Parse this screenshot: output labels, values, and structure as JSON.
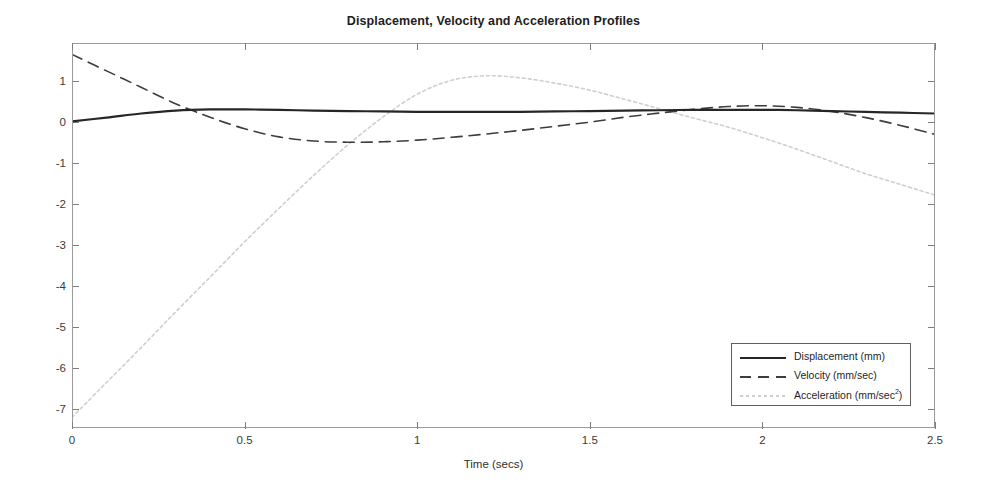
{
  "chart_data": {
    "type": "line",
    "title": "Displacement, Velocity and Acceleration Profiles",
    "xlabel": "Time (secs)",
    "ylabel": "",
    "xlim": [
      0,
      2.5
    ],
    "ylim": [
      -7.46,
      1.93
    ],
    "grid": false,
    "legend_position": "lower right",
    "xticks": [
      {
        "value": 0,
        "label": "0"
      },
      {
        "value": 0.5,
        "label": "0.5"
      },
      {
        "value": 1,
        "label": "1"
      },
      {
        "value": 1.5,
        "label": "1.5"
      },
      {
        "value": 2,
        "label": "2"
      },
      {
        "value": 2.5,
        "label": "2.5"
      }
    ],
    "yticks": [
      {
        "value": 1,
        "label": "1"
      },
      {
        "value": 0,
        "label": "0"
      },
      {
        "value": -1,
        "label": "-1"
      },
      {
        "value": -2,
        "label": "-2"
      },
      {
        "value": -3,
        "label": "-3"
      },
      {
        "value": -4,
        "label": "-4"
      },
      {
        "value": -5,
        "label": "-5"
      },
      {
        "value": -6,
        "label": "-6"
      },
      {
        "value": -7,
        "label": "-7"
      }
    ],
    "x": [
      0,
      0.1,
      0.2,
      0.3,
      0.4,
      0.5,
      0.6,
      0.7,
      0.8,
      0.9,
      1.0,
      1.1,
      1.2,
      1.3,
      1.4,
      1.5,
      1.6,
      1.7,
      1.8,
      1.9,
      2.0,
      2.1,
      2.2,
      2.3,
      2.4,
      2.5
    ],
    "series": [
      {
        "name": "Displacement (mm)",
        "unit": "mm",
        "style": "solid",
        "color": "#262626",
        "width": 2.2,
        "values": [
          0.02,
          0.11,
          0.21,
          0.28,
          0.31,
          0.31,
          0.3,
          0.28,
          0.27,
          0.26,
          0.25,
          0.25,
          0.25,
          0.25,
          0.26,
          0.27,
          0.28,
          0.29,
          0.3,
          0.3,
          0.3,
          0.29,
          0.27,
          0.25,
          0.23,
          0.21
        ]
      },
      {
        "name": "Velocity (mm/sec)",
        "unit": "mm/sec",
        "style": "dashed",
        "color": "#3d3d3d",
        "width": 1.6,
        "values": [
          1.65,
          1.25,
          0.85,
          0.45,
          0.12,
          -0.16,
          -0.36,
          -0.46,
          -0.49,
          -0.48,
          -0.44,
          -0.37,
          -0.29,
          -0.2,
          -0.1,
          0.0,
          0.12,
          0.22,
          0.31,
          0.38,
          0.4,
          0.36,
          0.26,
          0.11,
          -0.08,
          -0.3
        ]
      },
      {
        "name": "Acceleration (mm/sec^2)",
        "unit": "mm/sec²",
        "style": "dotted",
        "color": "#cfcfcf",
        "width": 1.6,
        "values": [
          -7.2,
          -6.35,
          -5.5,
          -4.63,
          -3.78,
          -2.92,
          -2.1,
          -1.3,
          -0.55,
          0.12,
          0.68,
          1.02,
          1.13,
          1.08,
          0.95,
          0.78,
          0.56,
          0.33,
          0.1,
          -0.12,
          -0.38,
          -0.66,
          -0.96,
          -1.26,
          -1.52,
          -1.78
        ]
      }
    ]
  },
  "legend": {
    "items": [
      {
        "label": "Displacement (mm)",
        "base": "Displacement (mm)",
        "sup": ""
      },
      {
        "label": "Velocity (mm/sec)",
        "base": "Velocity (mm/sec)",
        "sup": ""
      },
      {
        "label": "Acceleration (mm/sec2)",
        "base_pre": "Acceleration (mm/sec",
        "sup": "2",
        "base_post": ")"
      }
    ]
  }
}
